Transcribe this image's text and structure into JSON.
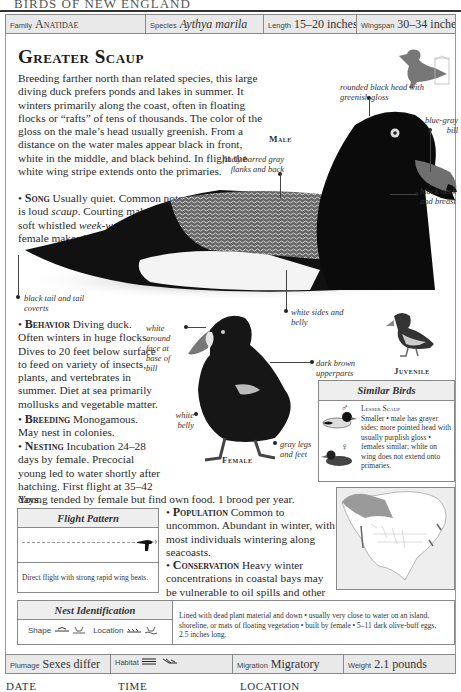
{
  "page": {
    "running_head": "BIRDS OF NEW ENGLAND"
  },
  "top_bar": {
    "family_label": "Family",
    "family_value": "Anatidae",
    "species_label": "Species",
    "species_value": "Aythya marila",
    "length_label": "Length",
    "length_value": "15–20 inches",
    "wingspan_label": "Wingspan",
    "wingspan_value": "30–34 inches"
  },
  "title": "Greater Scaup",
  "intro": "Breeding farther north than related species, this large diving duck prefers ponds and lakes in summer. It winters primarily along the coast, often in floating flocks or “rafts” of tens of thousands. The color of the gloss on the male’s head usually greenish. From a distance on the water males appear black in front, white in the middle, and black behind. In flight the white wing stripe extends onto the primaries.",
  "sections": {
    "song": {
      "heading": "Song",
      "pre": "Usually quiet. Common note is loud ",
      "scaup": "scaup",
      "mid": ". Courting males make soft whistled ",
      "week": "week-week-whew",
      "mid2": "; female makes low ",
      "harr": "harrrr",
      "end": "."
    },
    "behavior": {
      "heading": "Behavior",
      "text": "Diving duck. Often winters in huge flocks. Dives to 20 feet below surface to feed on variety of insects, plants, and vertebrates in summer. Diet at sea primarily mollusks and vegetable matter."
    },
    "breeding": {
      "heading": "Breeding",
      "text": "Monogamous. May nest in colonies."
    },
    "nesting": {
      "heading": "Nesting",
      "text": "Incubation 24–28 days by female. Precocial young led to water shortly after hatching. First flight at 35–42 days.",
      "text2": "Young tended by female but find own food. 1 brood per year."
    },
    "population": {
      "heading": "Population",
      "text": "Common to uncommon. Abundant in winter, with most individuals wintering along seacoasts."
    },
    "conservation": {
      "heading": "Conservation",
      "text": "Heavy winter concentrations in coastal bays may be vulnerable to oil spills and other pollution."
    }
  },
  "annotations": {
    "head": "rounded black head with greenish gloss",
    "bill": "blue-gray bill",
    "male": "Male",
    "flanks": "finely barred gray flanks and back",
    "neck": "black neck and breast",
    "tail": "black tail and tail coverts",
    "sides": "white sides and belly",
    "face": "white around face at base of bill",
    "upperparts": "dark brown upperparts",
    "belly": "white belly",
    "legs": "gray legs and feet",
    "female": "Female",
    "juvenile": "Juvenile"
  },
  "similar_birds": {
    "heading": "Similar Birds",
    "male_symbol": "♂",
    "female_symbol": "♀",
    "name": "Lesser Scaup",
    "text": "Smaller • male has grayer sides; more pointed head with usually purplish gloss • females similar; white on wing does not extend onto primaries."
  },
  "flight_pattern": {
    "heading": "Flight Pattern",
    "description": "Direct flight with strong rapid wing beats."
  },
  "nest_identification": {
    "heading": "Nest Identification",
    "shape_label": "Shape",
    "location_label": "Location",
    "description": "Lined with dead plant material and down • usually very close to water on an island, shoreline, or mats of floating vegetation • built by female • 5–11 dark olive-buff eggs, 2.5 inches long."
  },
  "bottom_bar": {
    "plumage_label": "Plumage",
    "plumage_value": "Sexes differ",
    "habitat_label": "Habitat",
    "migration_label": "Migration",
    "migration_value": "Migratory",
    "weight_label": "Weight",
    "weight_value": "2.1 pounds"
  },
  "footer": {
    "date": "DATE",
    "time": "TIME",
    "location": "LOCATION"
  },
  "colors": {
    "bar_bg": "#e9e9e9",
    "border": "#888888",
    "range_map_gray": "#9a9a9a"
  }
}
